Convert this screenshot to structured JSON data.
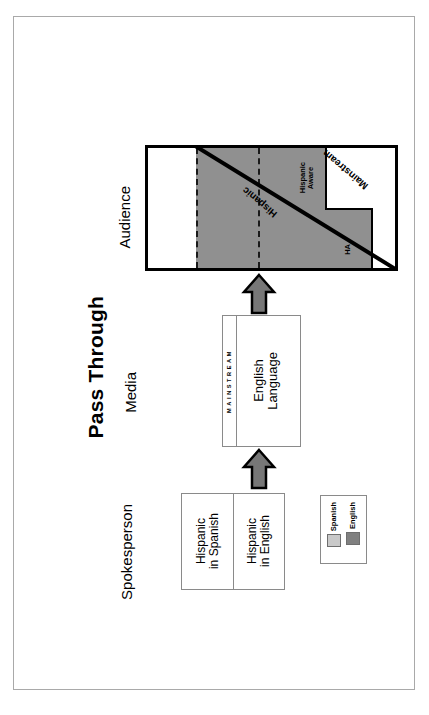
{
  "title": "Pass Through",
  "stages": {
    "audience": "Audience",
    "media": "Media",
    "spokesperson": "Spokesperson"
  },
  "audience": {
    "segments": [
      {
        "key": "spanish",
        "label": "Spanish"
      },
      {
        "key": "bilingual",
        "label": "Bilingual"
      },
      {
        "key": "english",
        "label": "English"
      }
    ],
    "hispanic_aware": "Hispanic\nAware",
    "ha_abbrev": "HA",
    "diagonal_labels": {
      "hispanic": "Hispanic",
      "mainstream": "Mainstream"
    }
  },
  "media": {
    "box_label": "English\nLanguage",
    "strip_letters": "MAINSTREAM"
  },
  "spokesperson": {
    "cells": [
      {
        "key": "spanish",
        "label": "Hispanic\nin Spanish"
      },
      {
        "key": "english",
        "label": "Hispanic\nin English"
      }
    ]
  },
  "legend": {
    "items": [
      {
        "label": "Spanish",
        "color": "#c9c9c9"
      },
      {
        "label": "English",
        "color": "#808080"
      }
    ]
  },
  "colors": {
    "shade": "#909090",
    "legend_spanish": "#c9c9c9",
    "legend_english": "#808080",
    "arrow_fill": "#777777",
    "frame": "#a9a9a9",
    "line": "#000000"
  }
}
